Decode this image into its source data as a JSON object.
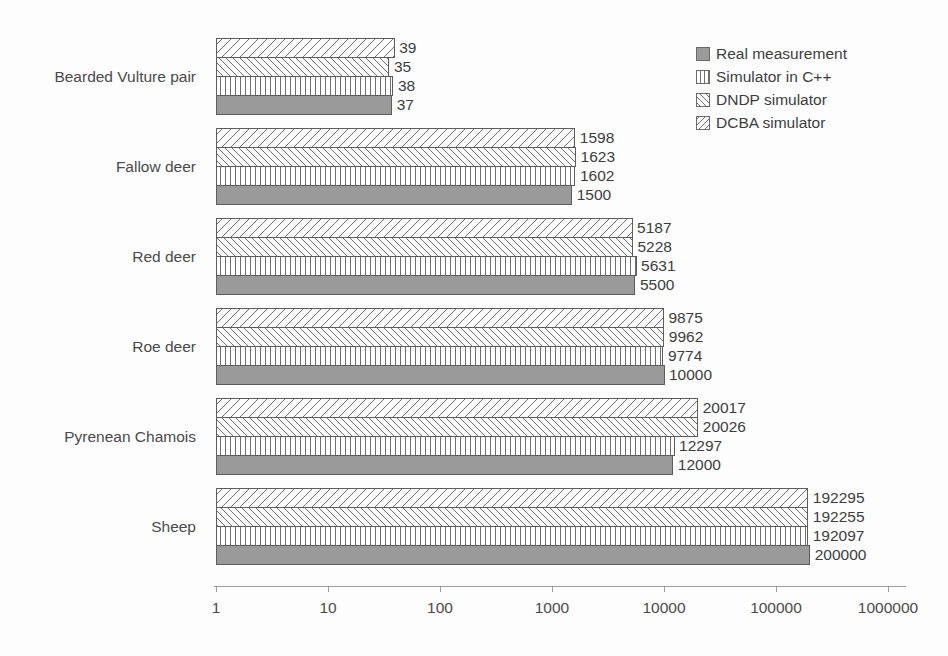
{
  "chart_data": {
    "type": "bar",
    "orientation": "horizontal",
    "title": "",
    "xlabel": "",
    "ylabel": "",
    "xscale": "log",
    "xlim": [
      1,
      1000000
    ],
    "xticks": [
      "1",
      "10",
      "100",
      "1000",
      "10000",
      "100000",
      "1000000"
    ],
    "xtick_values": [
      1,
      10,
      100,
      1000,
      10000,
      100000,
      1000000
    ],
    "grid": false,
    "legend_position": "top-right",
    "categories": [
      "Bearded Vulture pair",
      "Fallow deer",
      "Red deer",
      "Roe deer",
      "Pyrenean Chamois",
      "Sheep"
    ],
    "series": [
      {
        "name": "Real measurement",
        "pattern": "solid-gray",
        "color": "#9a9a9a",
        "values": [
          37,
          1500,
          5500,
          10000,
          12000,
          200000
        ]
      },
      {
        "name": "Simulator in C++",
        "pattern": "vertical-lines",
        "color": "#ffffff",
        "values": [
          38,
          1602,
          5631,
          9774,
          12297,
          192097
        ]
      },
      {
        "name": "DNDP simulator",
        "pattern": "backslash-hatch",
        "color": "#ffffff",
        "values": [
          35,
          1623,
          5228,
          9962,
          20026,
          192255
        ]
      },
      {
        "name": "DCBA simulator",
        "pattern": "forwardslash-hatch",
        "color": "#ffffff",
        "values": [
          39,
          1598,
          5187,
          9875,
          20017,
          192295
        ]
      }
    ],
    "value_labels": {
      "Bearded Vulture pair": [
        "39",
        "35",
        "38",
        "37"
      ],
      "Fallow deer": [
        "1598",
        "1623",
        "1602",
        "1500"
      ],
      "Red deer": [
        "5187",
        "5228",
        "5631",
        "5500"
      ],
      "Roe deer": [
        "9875",
        "9962",
        "9774",
        "10000"
      ],
      "Pyrenean Chamois": [
        "20017",
        "20026",
        "12297",
        "12000"
      ],
      "Sheep": [
        "192295",
        "192255",
        "192097",
        "200000"
      ]
    }
  },
  "legend": {
    "items": [
      {
        "label": "Real measurement",
        "swatch": "solid-gray-swatch"
      },
      {
        "label": "Simulator in C++",
        "swatch": "vertical-lines-swatch"
      },
      {
        "label": "DNDP simulator",
        "swatch": "backslash-hatch-swatch"
      },
      {
        "label": "DCBA simulator",
        "swatch": "forwardslash-hatch-swatch"
      }
    ]
  },
  "colors": {
    "bar_fill_real": "#9a9a9a",
    "bar_outline": "#5d5d5d",
    "axis": "#9e9e9e",
    "text": "#3d3d3d",
    "background": "#fdfdfd"
  }
}
